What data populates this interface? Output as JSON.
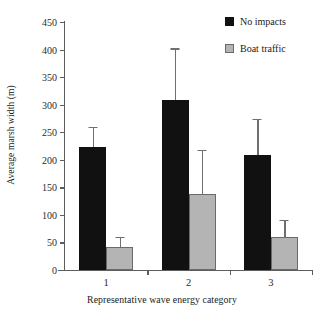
{
  "chart_data": {
    "type": "bar",
    "title": "",
    "xlabel": "Representative wave energy category",
    "ylabel": "Average marsh width (m)",
    "categories": [
      "1",
      "2",
      "3"
    ],
    "ylim": [
      0,
      450
    ],
    "yticks": [
      0,
      50,
      100,
      150,
      200,
      250,
      300,
      350,
      400,
      450
    ],
    "ytick_labels": [
      "0",
      "50",
      "100",
      "150",
      "200",
      "250",
      "300",
      "350",
      "400",
      "450"
    ],
    "grid": false,
    "legend_position": "top-right",
    "series": [
      {
        "name": "No impacts",
        "color": "#111111",
        "values": [
          223,
          308,
          209
        ],
        "errors": [
          34,
          92,
          63
        ]
      },
      {
        "name": "Boat traffic",
        "color": "#b4b4b4",
        "values": [
          42,
          138,
          60
        ],
        "errors": [
          16,
          78,
          29
        ]
      }
    ]
  },
  "legend": {
    "items": [
      {
        "label": "No impacts",
        "swatch": "dark"
      },
      {
        "label": "Boat traffic",
        "swatch": "light"
      }
    ]
  }
}
